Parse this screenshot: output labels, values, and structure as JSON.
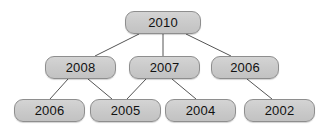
{
  "diagram": {
    "type": "tree",
    "background_color": "#ffffff",
    "node_fill_color": "#cccccc",
    "node_border_color": "#8e8e8e",
    "edge_color": "#555555",
    "text_color": "#111111",
    "nodes": [
      {
        "id": "n1",
        "label": "2010",
        "level": 0,
        "x": 125,
        "y": 11,
        "w": 76,
        "h": 23
      },
      {
        "id": "n2",
        "label": "2008",
        "level": 1,
        "x": 45,
        "y": 56,
        "w": 71,
        "h": 23
      },
      {
        "id": "n3",
        "label": "2007",
        "level": 1,
        "x": 129,
        "y": 56,
        "w": 71,
        "h": 23
      },
      {
        "id": "n4",
        "label": "2006",
        "level": 1,
        "x": 211,
        "y": 56,
        "w": 68,
        "h": 23
      },
      {
        "id": "n5",
        "label": "2006",
        "level": 2,
        "x": 14,
        "y": 99,
        "w": 71,
        "h": 23
      },
      {
        "id": "n6",
        "label": "2005",
        "level": 2,
        "x": 90,
        "y": 99,
        "w": 71,
        "h": 23
      },
      {
        "id": "n7",
        "label": "2004",
        "level": 2,
        "x": 165,
        "y": 99,
        "w": 71,
        "h": 23
      },
      {
        "id": "n8",
        "label": "2002",
        "level": 2,
        "x": 244,
        "y": 99,
        "w": 71,
        "h": 23
      }
    ],
    "edges": [
      {
        "from": "n1",
        "to": "n2",
        "x1": 139,
        "y1": 34,
        "x2": 95,
        "y2": 56
      },
      {
        "from": "n1",
        "to": "n3",
        "x1": 163,
        "y1": 34,
        "x2": 163,
        "y2": 56
      },
      {
        "from": "n1",
        "to": "n4",
        "x1": 186,
        "y1": 34,
        "x2": 231,
        "y2": 56
      },
      {
        "from": "n2",
        "to": "n5",
        "x1": 68,
        "y1": 79,
        "x2": 50,
        "y2": 99
      },
      {
        "from": "n2",
        "to": "n6",
        "x1": 88,
        "y1": 79,
        "x2": 112,
        "y2": 99
      },
      {
        "from": "n3",
        "to": "n6",
        "x1": 146,
        "y1": 79,
        "x2": 127,
        "y2": 99
      },
      {
        "from": "n3",
        "to": "n7",
        "x1": 172,
        "y1": 79,
        "x2": 196,
        "y2": 99
      },
      {
        "from": "n4",
        "to": "n8",
        "x1": 247,
        "y1": 79,
        "x2": 272,
        "y2": 99
      }
    ]
  }
}
